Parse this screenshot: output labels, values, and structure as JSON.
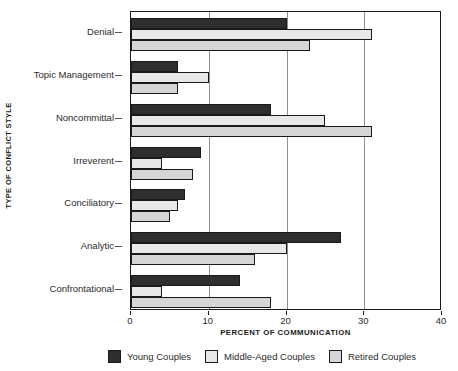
{
  "chart_data": {
    "type": "bar",
    "orientation": "horizontal",
    "title": "",
    "xlabel": "PERCENT OF COMMUNICATION",
    "ylabel": "TYPE OF CONFLICT STYLE",
    "xlim": [
      0,
      40
    ],
    "xticks": [
      0,
      10,
      20,
      30,
      40
    ],
    "xtick_labels": [
      "0",
      "10",
      "20",
      "30",
      "40"
    ],
    "grid": true,
    "grid_axis": "x",
    "legend_position": "bottom",
    "categories": [
      "Denial",
      "Topic Management",
      "Noncommittal",
      "Irreverent",
      "Conciliatory",
      "Analytic",
      "Confrontational"
    ],
    "series": [
      {
        "name": "Young Couples",
        "color": "#2e2e2e",
        "values": [
          20,
          6,
          18,
          9,
          7,
          27,
          14
        ]
      },
      {
        "name": "Middle-Aged Couples",
        "color": "#e8e8e8",
        "values": [
          31,
          10,
          25,
          4,
          6,
          20,
          4
        ]
      },
      {
        "name": "Retired Couples",
        "color": "#d6d6d6",
        "values": [
          23,
          6,
          31,
          8,
          5,
          16,
          18
        ]
      }
    ]
  },
  "legend": {
    "items": [
      {
        "label": "Young Couples",
        "swatch": "#2e2e2e"
      },
      {
        "label": "Middle-Aged Couples",
        "swatch": "#e8e8e8"
      },
      {
        "label": "Retired Couples",
        "swatch": "#d6d6d6"
      }
    ]
  }
}
